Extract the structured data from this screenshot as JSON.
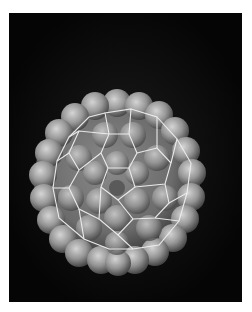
{
  "image": {
    "subject": "C60 buckminsterfullerene molecule with electron density surface and wireframe cage",
    "background_color": "#050505",
    "frame_color": "#ffffff",
    "surface_color": "#9a9a9a",
    "wireframe_color": "#f0f0f0"
  }
}
